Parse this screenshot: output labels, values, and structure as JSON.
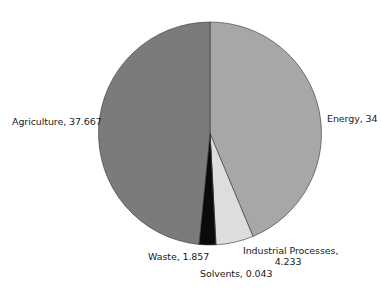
{
  "chart_data": {
    "type": "pie",
    "title": "",
    "start_angle": "12 o'clock",
    "direction": "clockwise",
    "legend": "none (direct labels)",
    "categories": [
      "Energy",
      "Industrial Processes",
      "Solvents",
      "Waste",
      "Agriculture"
    ],
    "values": [
      34,
      4.233,
      0.043,
      1.857,
      37.667
    ],
    "colors": [
      "#a7a7a7",
      "#dddddd",
      "#cfcfcf",
      "#0a0a0a",
      "#7b7b7b"
    ],
    "labels": {
      "energy": "Energy, 34",
      "industrial_line1": "Industrial Processes,",
      "industrial_line2": "4.233",
      "solvents": "Solvents, 0.043",
      "waste": "Waste, 1.857",
      "agriculture": "Agriculture, 37.667"
    }
  }
}
